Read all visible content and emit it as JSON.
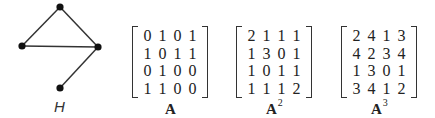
{
  "graph": {
    "label": "H",
    "nodes": [
      {
        "id": "top",
        "x": 60,
        "y": 7
      },
      {
        "id": "left",
        "x": 22,
        "y": 46
      },
      {
        "id": "right",
        "x": 98,
        "y": 47
      },
      {
        "id": "bottom",
        "x": 60,
        "y": 88
      }
    ],
    "edges": [
      [
        "top",
        "left"
      ],
      [
        "top",
        "right"
      ],
      [
        "left",
        "right"
      ],
      [
        "right",
        "bottom"
      ]
    ]
  },
  "matrices": [
    {
      "label": "A",
      "power": "",
      "rows": [
        [
          "0",
          "1",
          "0",
          "1"
        ],
        [
          "1",
          "0",
          "1",
          "1"
        ],
        [
          "0",
          "1",
          "0",
          "0"
        ],
        [
          "1",
          "1",
          "0",
          "0"
        ]
      ]
    },
    {
      "label": "A",
      "power": "2",
      "rows": [
        [
          "2",
          "1",
          "1",
          "1"
        ],
        [
          "1",
          "3",
          "0",
          "1"
        ],
        [
          "1",
          "0",
          "1",
          "1"
        ],
        [
          "1",
          "1",
          "1",
          "2"
        ]
      ]
    },
    {
      "label": "A",
      "power": "3",
      "rows": [
        [
          "2",
          "4",
          "1",
          "3"
        ],
        [
          "4",
          "2",
          "3",
          "4"
        ],
        [
          "1",
          "3",
          "0",
          "1"
        ],
        [
          "3",
          "4",
          "1",
          "2"
        ]
      ]
    }
  ]
}
